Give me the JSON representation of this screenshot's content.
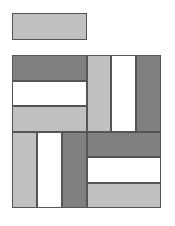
{
  "colors": {
    "light": "#c0c0c0",
    "dark": "#808080",
    "white": "#ffffff",
    "border": "#555555"
  },
  "blocks": [
    {
      "name": "top-bar",
      "x": 12,
      "y": 13,
      "w": 75,
      "h": 27,
      "fill": "light"
    },
    {
      "name": "tl-dark",
      "x": 12,
      "y": 55,
      "w": 75,
      "h": 26,
      "fill": "dark"
    },
    {
      "name": "tl-white",
      "x": 12,
      "y": 81,
      "w": 75,
      "h": 25,
      "fill": "white"
    },
    {
      "name": "tl-light",
      "x": 12,
      "y": 106,
      "w": 75,
      "h": 26,
      "fill": "light"
    },
    {
      "name": "tr-light",
      "x": 87,
      "y": 55,
      "w": 24,
      "h": 77,
      "fill": "light"
    },
    {
      "name": "tr-white",
      "x": 111,
      "y": 55,
      "w": 25,
      "h": 77,
      "fill": "white"
    },
    {
      "name": "tr-dark",
      "x": 136,
      "y": 55,
      "w": 25,
      "h": 77,
      "fill": "dark"
    },
    {
      "name": "bl-light",
      "x": 12,
      "y": 132,
      "w": 25,
      "h": 76,
      "fill": "light"
    },
    {
      "name": "bl-white",
      "x": 37,
      "y": 132,
      "w": 25,
      "h": 76,
      "fill": "white"
    },
    {
      "name": "bl-dark",
      "x": 62,
      "y": 132,
      "w": 25,
      "h": 76,
      "fill": "dark"
    },
    {
      "name": "br-dark",
      "x": 87,
      "y": 132,
      "w": 74,
      "h": 25,
      "fill": "dark"
    },
    {
      "name": "br-white",
      "x": 87,
      "y": 157,
      "w": 74,
      "h": 26,
      "fill": "white"
    },
    {
      "name": "br-light",
      "x": 87,
      "y": 183,
      "w": 74,
      "h": 25,
      "fill": "light"
    }
  ]
}
